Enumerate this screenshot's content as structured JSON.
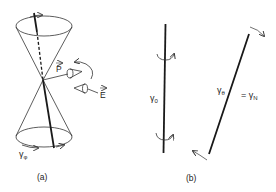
{
  "figure": {
    "panel_a": {
      "caption": "(a)",
      "labels": {
        "polarization": "P",
        "field": "E",
        "angle_phi_base": "γ",
        "angle_phi_sub": "φ"
      }
    },
    "panel_b": {
      "caption": "(b)",
      "labels": {
        "gamma0_base": "γ",
        "gamma0_sub": "0",
        "gammatheta_base": "γ",
        "gammatheta_sub": "θ",
        "equals_gammaN_prefix": "= γ",
        "equals_gammaN_sub": "N"
      }
    },
    "colors": {
      "line": "#1a1a1a",
      "thin_line": "#333333",
      "background": "#ffffff"
    }
  }
}
